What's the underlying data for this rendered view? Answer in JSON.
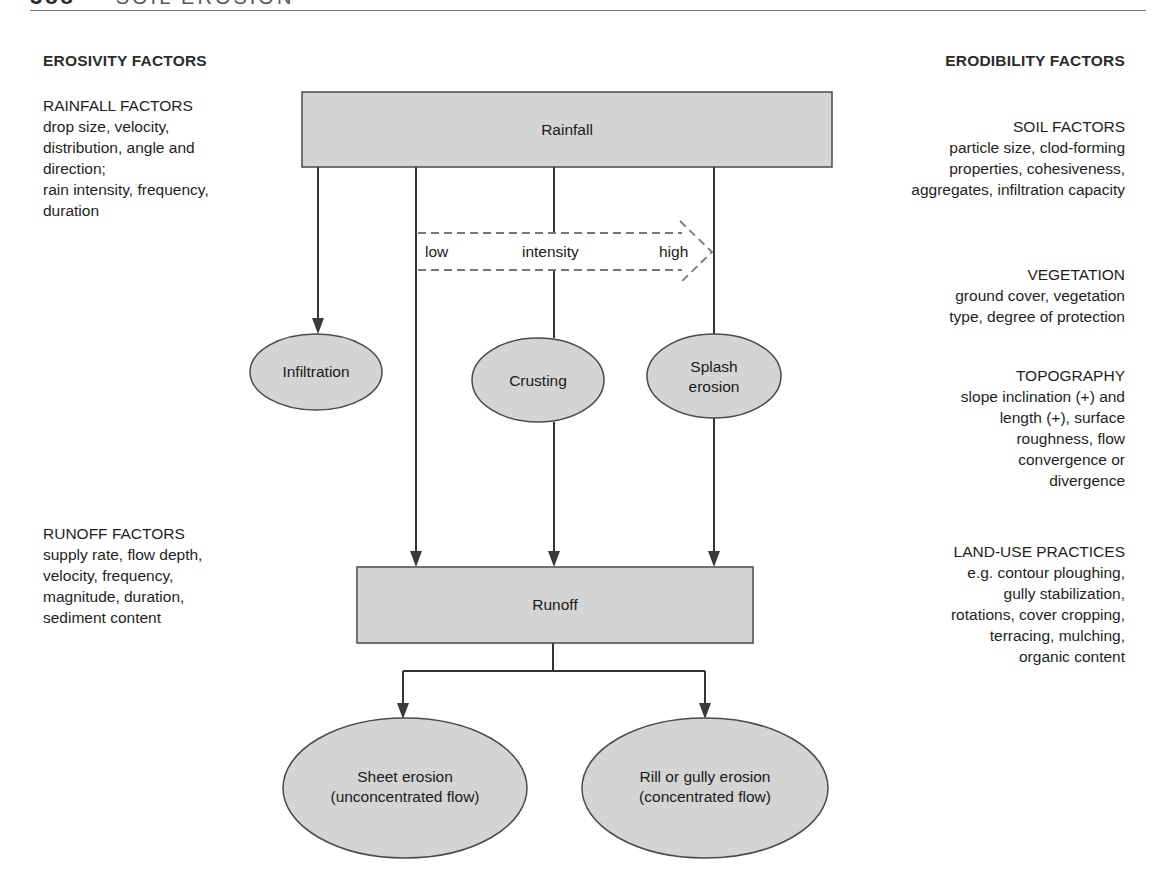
{
  "header": {
    "page_number": "388",
    "section": "SOIL EROSION"
  },
  "left_column": {
    "heading": "EROSIVITY FACTORS",
    "blocks": [
      {
        "title": "RAINFALL FACTORS",
        "lines": [
          "drop size, velocity,",
          "distribution, angle and",
          "direction;",
          "rain intensity, frequency,",
          "duration"
        ]
      },
      {
        "title": "RUNOFF FACTORS",
        "lines": [
          "supply rate, flow depth,",
          "velocity, frequency,",
          "magnitude, duration,",
          "sediment content"
        ]
      }
    ]
  },
  "right_column": {
    "heading": "ERODIBILITY FACTORS",
    "blocks": [
      {
        "title": "SOIL FACTORS",
        "lines": [
          "particle size, clod-forming",
          "properties, cohesiveness,",
          "aggregates, infiltration capacity"
        ]
      },
      {
        "title": "VEGETATION",
        "lines": [
          "ground cover, vegetation",
          "type, degree of protection"
        ]
      },
      {
        "title": "TOPOGRAPHY",
        "lines": [
          "slope inclination (+) and",
          "length (+), surface",
          "roughness, flow",
          "convergence or",
          "divergence"
        ]
      },
      {
        "title": "LAND-USE PRACTICES",
        "lines": [
          "e.g. contour ploughing,",
          "gully stabilization,",
          "rotations, cover cropping,",
          "terracing, mulching,",
          "organic content"
        ]
      }
    ]
  },
  "nodes": {
    "rainfall": "Rainfall",
    "infiltration": "Infiltration",
    "crusting": "Crusting",
    "splash_erosion": [
      "Splash",
      "erosion"
    ],
    "runoff": "Runoff",
    "sheet_erosion": [
      "Sheet erosion",
      "(unconcentrated flow)"
    ],
    "rill_gully_erosion": [
      "Rill or gully erosion",
      "(concentrated flow)"
    ]
  },
  "intensity_arrow": {
    "low": "low",
    "label": "intensity",
    "high": "high"
  },
  "colors": {
    "node_fill": "#d4d4d4",
    "node_stroke": "#4a4a4a",
    "line": "#333333",
    "dashed": "#777777"
  }
}
